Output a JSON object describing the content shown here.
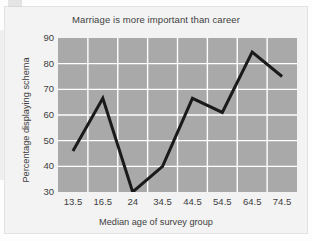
{
  "chart_data": {
    "type": "line",
    "title": "Marriage is more important than career",
    "xlabel": "Median age of survey group",
    "ylabel": "Percentage displaying schema",
    "categories": [
      "13.5",
      "16.5",
      "24",
      "34.5",
      "44.5",
      "54.5",
      "64.5",
      "74.5"
    ],
    "values": [
      46,
      66.5,
      30,
      40,
      66.5,
      61,
      84.5,
      75
    ],
    "series": [
      {
        "name": "Percentage displaying schema",
        "values": [
          46,
          66.5,
          30,
          40,
          66.5,
          61,
          84.5,
          75
        ]
      }
    ],
    "ylim": [
      30,
      90
    ],
    "yticks": [
      30,
      40,
      50,
      60,
      70,
      80,
      90
    ],
    "ytick_labels": [
      "30",
      "40",
      "50",
      "60",
      "70",
      "80",
      "90"
    ],
    "grid": true,
    "grid_color": "#ffffff",
    "legend": false,
    "legend_position": "none",
    "plot_background": "#a9a9a9",
    "line_color": "#1a1a1a",
    "line_width": 3,
    "markers": false,
    "page_background": "#f3f3f3"
  }
}
